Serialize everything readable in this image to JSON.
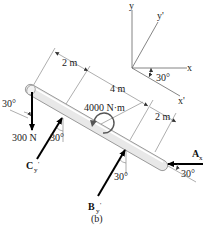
{
  "figure_label": "(b)",
  "axes": {
    "x": "x",
    "y": "y",
    "x_prime": "x'",
    "y_prime": "y'",
    "rotation_angle": "30°"
  },
  "dimensions": {
    "d1": "2 m",
    "d2": "4 m",
    "d3": "2 m"
  },
  "loads": {
    "applied_force": "300 N",
    "applied_force_angle": "30°",
    "couple_moment": "4000 N·m"
  },
  "reactions": {
    "C": {
      "symbol": "C",
      "subscript": "y",
      "prime": "'",
      "angle": "30°"
    },
    "B": {
      "symbol": "B",
      "subscript": "y",
      "prime": "'",
      "angle": "30°"
    },
    "A": {
      "symbol": "A",
      "subscript": "x",
      "angle": "30°"
    }
  },
  "colors": {
    "rod_fill": "#e8e8e8",
    "rod_stroke": "#9a9a9a",
    "force": "#000000",
    "dimension_line": "#777777"
  }
}
